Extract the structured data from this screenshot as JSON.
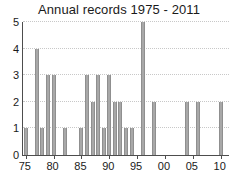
{
  "chart_data": {
    "type": "bar",
    "title": "Annual records 1975 - 2011",
    "xlabel": "",
    "ylabel": "",
    "xlim": [
      1974.5,
      2011.5
    ],
    "ylim": [
      0,
      5
    ],
    "grid": true,
    "legend": null,
    "bar_color": "#a8a8a8",
    "axis_color": "#4d4d4d",
    "grid_color": "#c8c8c8",
    "ytick_values": [
      0,
      1,
      2,
      3,
      4,
      5
    ],
    "ytick_labels": [
      "0",
      "1",
      "2",
      "3",
      "4",
      "5"
    ],
    "xtick_values": [
      1975,
      1980,
      1985,
      1990,
      1995,
      2000,
      2005,
      2010
    ],
    "xtick_labels": [
      "75",
      "80",
      "85",
      "90",
      "95",
      "00",
      "05",
      "10"
    ],
    "categories": [
      1975,
      1976,
      1977,
      1978,
      1979,
      1980,
      1981,
      1982,
      1983,
      1984,
      1985,
      1986,
      1987,
      1988,
      1989,
      1990,
      1991,
      1992,
      1993,
      1994,
      1995,
      1996,
      1997,
      1998,
      1999,
      2000,
      2001,
      2002,
      2003,
      2004,
      2005,
      2006,
      2007,
      2008,
      2009,
      2010,
      2011
    ],
    "values": [
      1,
      0,
      4,
      1,
      3,
      3,
      0,
      1,
      0,
      0,
      1,
      3,
      2,
      3,
      1,
      3,
      2,
      2,
      1,
      1,
      0,
      5,
      0,
      2,
      0,
      0,
      0,
      0,
      0,
      2,
      0,
      2,
      0,
      0,
      0,
      2,
      0
    ]
  }
}
